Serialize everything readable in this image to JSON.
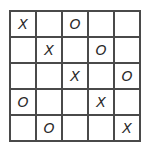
{
  "board": {
    "rows": 5,
    "cols": 5,
    "line_color": "#4a4a4a",
    "mark_color": "#2a2a2a",
    "cells": [
      [
        "X",
        "",
        "O",
        "",
        ""
      ],
      [
        "",
        "X",
        "",
        "O",
        ""
      ],
      [
        "",
        "",
        "X",
        "",
        "O"
      ],
      [
        "O",
        "",
        "",
        "X",
        ""
      ],
      [
        "",
        "O",
        "",
        "",
        "X"
      ]
    ]
  }
}
